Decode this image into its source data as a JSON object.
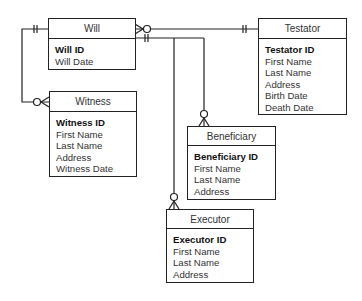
{
  "entities": {
    "will": {
      "name": "Will",
      "pk": "Will ID",
      "attributes": [
        "Will Date"
      ]
    },
    "testator": {
      "name": "Testator",
      "pk": "Testator ID",
      "attributes": [
        "First Name",
        "Last Name",
        "Address",
        "Birth Date",
        "Death Date"
      ]
    },
    "witness": {
      "name": "Witness",
      "pk": "Witness ID",
      "attributes": [
        "First Name",
        "Last Name",
        "Address",
        "Witness Date"
      ]
    },
    "beneficiary": {
      "name": "Beneficiary",
      "pk": "Beneficiary ID",
      "attributes": [
        "First Name",
        "Last Name",
        "Address"
      ]
    },
    "executor": {
      "name": "Executor",
      "pk": "Executor ID",
      "attributes": [
        "First Name",
        "Last Name",
        "Address"
      ]
    }
  },
  "relationships": [
    {
      "from": "Will",
      "from_cardinality": "zero-or-many",
      "to": "Testator",
      "to_cardinality": "one-and-only-one"
    },
    {
      "from": "Will",
      "from_cardinality": "one-and-only-one",
      "to": "Witness",
      "to_cardinality": "zero-or-many"
    },
    {
      "from": "Will",
      "from_cardinality": "one-and-only-one",
      "to": "Beneficiary",
      "to_cardinality": "zero-or-many"
    },
    {
      "from": "Will",
      "from_cardinality": "one-and-only-one",
      "to": "Executor",
      "to_cardinality": "zero-or-many"
    }
  ],
  "colors": {
    "line": "#222222",
    "background": "#ffffff"
  }
}
